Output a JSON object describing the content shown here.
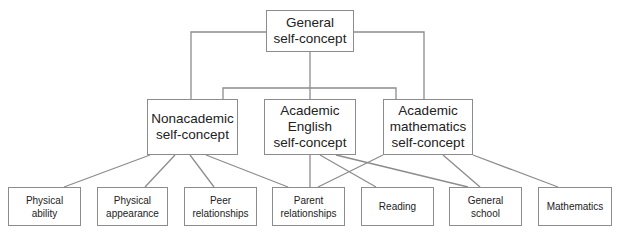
{
  "diagram": {
    "type": "hierarchy",
    "root": {
      "id": "general",
      "label": "General\nself-concept"
    },
    "level2": [
      {
        "id": "nonacademic",
        "label": "Nonacademic\nself-concept"
      },
      {
        "id": "english",
        "label": "Academic\nEnglish\nself-concept"
      },
      {
        "id": "mathematics",
        "label": "Academic\nmathematics\nself-concept"
      }
    ],
    "level3": [
      {
        "id": "physical-ability",
        "label": "Physical\nability"
      },
      {
        "id": "physical-appearance",
        "label": "Physical\nappearance"
      },
      {
        "id": "peer-relationships",
        "label": "Peer\nrelationships"
      },
      {
        "id": "parent-relationships",
        "label": "Parent\nrelationships"
      },
      {
        "id": "reading",
        "label": "Reading"
      },
      {
        "id": "general-school",
        "label": "General\nschool"
      },
      {
        "id": "math",
        "label": "Mathematics"
      }
    ],
    "edges": [
      [
        "general",
        "nonacademic"
      ],
      [
        "general",
        "english"
      ],
      [
        "general",
        "mathematics"
      ],
      [
        "nonacademic",
        "physical-ability"
      ],
      [
        "nonacademic",
        "physical-appearance"
      ],
      [
        "nonacademic",
        "peer-relationships"
      ],
      [
        "nonacademic",
        "parent-relationships"
      ],
      [
        "english",
        "parent-relationships"
      ],
      [
        "english",
        "reading"
      ],
      [
        "english",
        "general-school"
      ],
      [
        "mathematics",
        "parent-relationships"
      ],
      [
        "mathematics",
        "general-school"
      ],
      [
        "mathematics",
        "math"
      ]
    ],
    "colors": {
      "line": "#8c8c8c",
      "text": "#222222",
      "background": "#ffffff"
    }
  }
}
